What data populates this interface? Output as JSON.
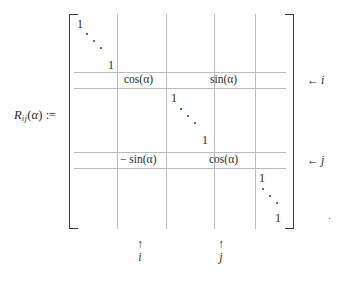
{
  "equation": {
    "lhs": {
      "symbol": "R",
      "subscript": "ij",
      "argument_open": "(",
      "argument": "α",
      "argument_close": ")",
      "assign": ":="
    },
    "trailing_punctuation": "."
  },
  "matrix": {
    "bracket_left": "[",
    "bracket_right": "]",
    "entries": [
      {
        "name": "top-left-one",
        "text": "1"
      },
      {
        "name": "top-left-ddots",
        "text": "⋱"
      },
      {
        "name": "top-left-one-lower",
        "text": "1"
      },
      {
        "name": "cos-alpha-row-i",
        "text": "cos(α)"
      },
      {
        "name": "sin-alpha-row-i",
        "text": "sin(α)"
      },
      {
        "name": "middle-one-upper",
        "text": "1"
      },
      {
        "name": "middle-ddots",
        "text": "⋱"
      },
      {
        "name": "middle-one-lower",
        "text": "1"
      },
      {
        "name": "neg-sin-alpha-row-j",
        "text": "− sin(α)"
      },
      {
        "name": "cos-alpha-row-j",
        "text": "cos(α)"
      },
      {
        "name": "bottom-one-upper",
        "text": "1"
      },
      {
        "name": "bottom-ddots",
        "text": "⋱"
      },
      {
        "name": "bottom-one-lower",
        "text": "1"
      }
    ],
    "row_markers": [
      {
        "arrow": "←",
        "index": "i"
      },
      {
        "arrow": "←",
        "index": "j"
      }
    ],
    "column_markers": [
      {
        "arrow": "↑",
        "index": "i"
      },
      {
        "arrow": "↑",
        "index": "j"
      }
    ]
  },
  "colors": {
    "text": "#2b2b2b",
    "grid_rule": "#b9bcc4",
    "bracket": "#3a3a3a",
    "background": "#ffffff"
  }
}
